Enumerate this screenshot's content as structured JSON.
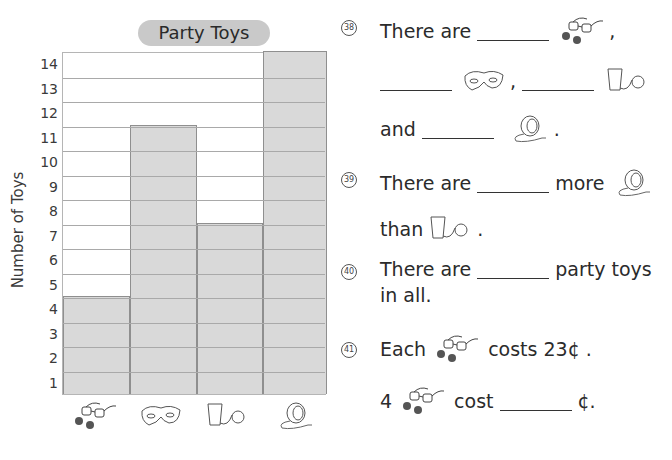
{
  "chart_data": {
    "type": "bar",
    "title": "Party Toys",
    "xlabel": "",
    "ylabel": "Number of Toys",
    "categories": [
      "glasses",
      "mask",
      "cup-and-ball",
      "yo-yo"
    ],
    "values": [
      4,
      11,
      7,
      14
    ],
    "ylim": [
      0,
      14
    ],
    "yticks": [
      1,
      2,
      3,
      4,
      5,
      6,
      7,
      8,
      9,
      10,
      11,
      12,
      13,
      14
    ],
    "grid": true,
    "legend": null
  },
  "chart": {
    "title": "Party Toys",
    "ylabel": "Number of Toys",
    "ticks": [
      "1",
      "2",
      "3",
      "4",
      "5",
      "6",
      "7",
      "8",
      "9",
      "10",
      "11",
      "12",
      "13",
      "14"
    ],
    "icons": [
      "glasses-icon",
      "mask-icon",
      "cup-and-ball-icon",
      "yoyo-icon"
    ]
  },
  "colors": {
    "bar_fill": "#d9d9d9",
    "grid": "#a9a9a9",
    "title_pill": "#c9c9c9"
  },
  "questions": {
    "q38": {
      "num": "38",
      "line1_prefix": "There are",
      "line1_suffix": ",",
      "line2_sep": ",",
      "line3_prefix": "and",
      "line3_suffix": "."
    },
    "q39": {
      "num": "39",
      "line1_prefix": "There are",
      "line1_mid": "more",
      "line2_prefix": "than",
      "line2_suffix": "."
    },
    "q40": {
      "num": "40",
      "line1_prefix": "There are",
      "line1_suffix": "party toys",
      "line2": "in all."
    },
    "q41": {
      "num": "41",
      "line1_prefix": "Each",
      "line1_suffix": "costs 23¢ .",
      "line2_prefix": "4",
      "line2_mid": "cost",
      "line2_suffix": "¢."
    }
  }
}
